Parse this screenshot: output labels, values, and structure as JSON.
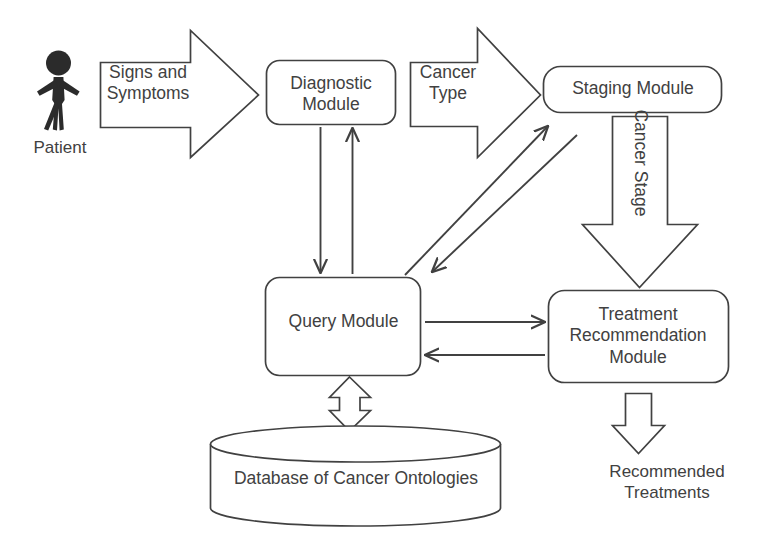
{
  "diagram": {
    "stroke_color": "#414141",
    "text_color": "#414141",
    "background_color": "#ffffff",
    "actors": [
      {
        "id": "patient",
        "name": "patient-actor",
        "label": "Patient",
        "shape": "stick-figure"
      }
    ],
    "nodes": [
      {
        "id": "diagnostic",
        "name": "diagnostic-module-node",
        "label": "Diagnostic\nModule",
        "shape": "rounded-rect"
      },
      {
        "id": "staging",
        "name": "staging-module-node",
        "label": "Staging Module",
        "shape": "rounded-rect"
      },
      {
        "id": "query",
        "name": "query-module-node",
        "label": "Query Module",
        "shape": "rounded-rect"
      },
      {
        "id": "treatment",
        "name": "treatment-recommendation-module-node",
        "label": "Treatment\nRecommendation\nModule",
        "shape": "rounded-rect"
      },
      {
        "id": "database",
        "name": "database-node",
        "label": "Database of Cancer Ontologies",
        "shape": "cylinder"
      }
    ],
    "block_arrows": [
      {
        "id": "signs",
        "name": "signs-and-symptoms-arrow",
        "label": "Signs and\nSymptoms",
        "direction": "right",
        "from": "patient",
        "to": "diagnostic"
      },
      {
        "id": "cancer_type",
        "name": "cancer-type-arrow",
        "label": "Cancer\nType",
        "direction": "right",
        "from": "diagnostic",
        "to": "staging"
      },
      {
        "id": "cancer_stage",
        "name": "cancer-stage-arrow",
        "label": "Cancer Stage",
        "direction": "down",
        "from": "staging",
        "to": "treatment"
      },
      {
        "id": "db_link",
        "name": "query-database-double-arrow",
        "label": "",
        "direction": "both-vertical",
        "from": "query",
        "to": "database"
      },
      {
        "id": "output",
        "name": "recommended-treatments-arrow",
        "label": "",
        "direction": "down",
        "from": "treatment",
        "to": "recommended_treatments"
      }
    ],
    "line_arrows": [
      {
        "id": "diag_to_query",
        "name": "diagnostic-to-query-arrow",
        "direction": "down",
        "from": "diagnostic",
        "to": "query"
      },
      {
        "id": "query_to_diag",
        "name": "query-to-diagnostic-arrow",
        "direction": "up",
        "from": "query",
        "to": "diagnostic"
      },
      {
        "id": "query_to_staging",
        "name": "query-to-staging-arrow",
        "direction": "up-right",
        "from": "query",
        "to": "staging"
      },
      {
        "id": "staging_to_query",
        "name": "staging-to-query-arrow",
        "direction": "down-left",
        "from": "staging",
        "to": "query"
      },
      {
        "id": "query_to_treatment",
        "name": "query-to-treatment-arrow",
        "direction": "right",
        "from": "query",
        "to": "treatment"
      },
      {
        "id": "treatment_to_query",
        "name": "treatment-to-query-arrow",
        "direction": "left",
        "from": "treatment",
        "to": "query"
      }
    ],
    "outputs": [
      {
        "id": "recommended_treatments",
        "name": "recommended-treatments-label",
        "label": "Recommended\nTreatments"
      }
    ]
  }
}
